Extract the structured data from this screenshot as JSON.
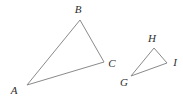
{
  "figure": {
    "type": "geometry-diagram",
    "background_color": "#ffffff",
    "stroke_color": "#8a8a8a",
    "label_color": "#2e2e2e",
    "stroke_width": 1,
    "width": 183,
    "height": 103,
    "shapes": [
      {
        "name": "triangle-abc",
        "kind": "triangle",
        "vertices": [
          {
            "label": "A",
            "x": 27,
            "y": 85,
            "label_x": 14,
            "label_y": 90
          },
          {
            "label": "B",
            "x": 80,
            "y": 20,
            "label_x": 78,
            "label_y": 9
          },
          {
            "label": "C",
            "x": 104,
            "y": 62,
            "label_x": 112,
            "label_y": 63
          }
        ],
        "points": "27,85 80,20 104,62"
      },
      {
        "name": "triangle-ghi",
        "kind": "triangle",
        "vertices": [
          {
            "label": "G",
            "x": 131,
            "y": 76,
            "label_x": 124,
            "label_y": 82
          },
          {
            "label": "H",
            "x": 154,
            "y": 48,
            "label_x": 152,
            "label_y": 38
          },
          {
            "label": "I",
            "x": 167,
            "y": 63,
            "label_x": 175,
            "label_y": 62
          }
        ],
        "points": "131,76 154,48 167,63"
      }
    ]
  }
}
